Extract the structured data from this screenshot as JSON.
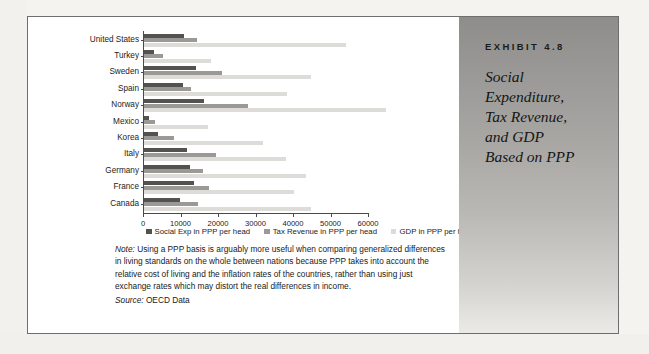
{
  "exhibit": {
    "label": "EXHIBIT 4.8",
    "title": "Social\nExpenditure,\nTax Revenue,\nand GDP\nBased on PPP"
  },
  "notes": {
    "note_prefix": "Note:",
    "note_text": " Using a PPP basis is arguably more useful when comparing generalized differences in living standards on the whole between nations because PPP takes into account the relative cost of living and the inflation rates of the countries, rather than using just exchange rates which may distort the real differences in income.",
    "source_prefix": "Source:",
    "source_text": " OECD Data"
  },
  "colors": {
    "series_social": "#54524f",
    "series_tax": "#9b9995",
    "series_gdp": "#dedcd8",
    "axis": "#4a4a4a",
    "panel_top": "#8e8d8a",
    "panel_bottom": "#eceae7"
  },
  "chart_data": {
    "type": "bar",
    "orientation": "horizontal",
    "title": "",
    "xlabel": "",
    "ylabel": "",
    "xlim": [
      0,
      60000
    ],
    "xticks": [
      0,
      10000,
      20000,
      30000,
      40000,
      50000,
      60000
    ],
    "xtick_labels": [
      "0",
      "10000",
      "20000",
      "30000",
      "40000",
      "50000",
      "60000"
    ],
    "grid": false,
    "legend_position": "bottom",
    "categories": [
      "United States",
      "Turkey",
      "Sweden",
      "Spain",
      "Norway",
      "Mexico",
      "Korea",
      "Italy",
      "Germany",
      "France",
      "Canada"
    ],
    "series": [
      {
        "name": "Social Exp in PPP per head",
        "color": "#54524f",
        "values": [
          10700,
          2700,
          13900,
          10400,
          16000,
          1200,
          3800,
          11400,
          12300,
          13200,
          9600
        ]
      },
      {
        "name": "Tax Revenue in PPP per head",
        "color": "#9b9995",
        "values": [
          14000,
          5000,
          20800,
          12500,
          27700,
          2900,
          8000,
          19200,
          15800,
          17400,
          14500
        ]
      },
      {
        "name": "GDP in PPP per head",
        "color": "#dedcd8",
        "values": [
          53800,
          17900,
          44500,
          38100,
          64500,
          17100,
          31800,
          37800,
          43200,
          40000,
          44400
        ]
      }
    ]
  }
}
